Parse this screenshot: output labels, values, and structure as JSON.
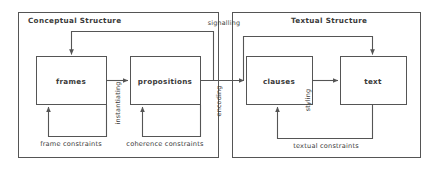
{
  "diagram": {
    "stroke_color": "#555555",
    "text_color": "#3a3a3a",
    "background": "#ffffff",
    "groups": [
      {
        "id": "conceptual",
        "label": "Conceptual Structure",
        "x": 18,
        "y": 12,
        "w": 200,
        "h": 145
      },
      {
        "id": "textual",
        "label": "Textual Structure",
        "x": 232,
        "y": 12,
        "w": 188,
        "h": 145
      }
    ],
    "boxes": [
      {
        "id": "frames",
        "label": "frames",
        "x": 36,
        "y": 56,
        "w": 70,
        "h": 48
      },
      {
        "id": "propositions",
        "label": "propositions",
        "x": 130,
        "y": 56,
        "w": 70,
        "h": 48
      },
      {
        "id": "clauses",
        "label": "clauses",
        "x": 246,
        "y": 56,
        "w": 66,
        "h": 48
      },
      {
        "id": "text",
        "label": "text",
        "x": 340,
        "y": 56,
        "w": 66,
        "h": 48
      }
    ],
    "edge_labels": [
      {
        "id": "instantiating",
        "label": "instantiating",
        "orient": "vertical",
        "x": 118,
        "y": 104
      },
      {
        "id": "signalling",
        "label": "signalling",
        "orient": "horizontal",
        "x": 224,
        "y": 23
      },
      {
        "id": "encoding",
        "label": "encoding",
        "orient": "vertical",
        "x": 218,
        "y": 101
      },
      {
        "id": "styling",
        "label": "styling",
        "orient": "vertical",
        "x": 308,
        "y": 100
      }
    ],
    "constraint_labels": [
      {
        "id": "frame-constraints",
        "label": "frame constraints",
        "x": 71,
        "y": 144
      },
      {
        "id": "coherence-constraints",
        "label": "coherence constraints",
        "x": 165,
        "y": 144
      },
      {
        "id": "textual-constraints",
        "label": "textual constraints",
        "x": 326,
        "y": 146
      }
    ]
  }
}
